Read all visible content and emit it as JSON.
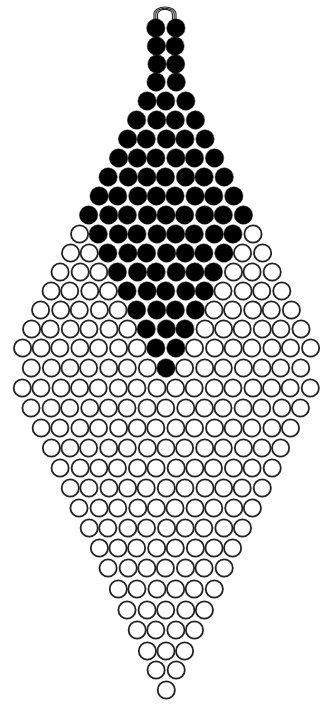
{
  "diagram": {
    "type": "bead-pattern",
    "colors": {
      "filled": "#000000",
      "open": "#ffffff",
      "outline": "#222222",
      "background": "#ffffff"
    },
    "loop": {
      "cx": 165,
      "cy": 14,
      "rx": 11,
      "ry": 7,
      "strands": 3
    },
    "bead_spacing_x": 19.2,
    "bead_radius": 8.6,
    "rows": [
      {
        "y": 28,
        "beads": [
          "F",
          "F"
        ]
      },
      {
        "y": 46,
        "beads": [
          "F",
          "F"
        ]
      },
      {
        "y": 64,
        "beads": [
          "F",
          "F"
        ]
      },
      {
        "y": 82,
        "beads": [
          "F",
          "F"
        ]
      },
      {
        "y": 101,
        "beads": [
          "F",
          "F",
          "F"
        ]
      },
      {
        "y": 120,
        "beads": [
          "F",
          "F",
          "F",
          "F"
        ]
      },
      {
        "y": 139,
        "beads": [
          "F",
          "F",
          "F",
          "F",
          "F"
        ]
      },
      {
        "y": 158,
        "beads": [
          "F",
          "F",
          "F",
          "F",
          "F",
          "F"
        ]
      },
      {
        "y": 177,
        "beads": [
          "F",
          "F",
          "F",
          "F",
          "F",
          "F",
          "F"
        ]
      },
      {
        "y": 196,
        "beads": [
          "F",
          "F",
          "F",
          "F",
          "F",
          "F",
          "F",
          "F"
        ]
      },
      {
        "y": 215,
        "beads": [
          "F",
          "F",
          "F",
          "F",
          "F",
          "F",
          "F",
          "F",
          "F"
        ]
      },
      {
        "y": 234,
        "beads": [
          "O",
          "F",
          "F",
          "F",
          "F",
          "F",
          "F",
          "F",
          "F",
          "O"
        ]
      },
      {
        "y": 253,
        "beads": [
          "O",
          "O",
          "F",
          "F",
          "F",
          "F",
          "F",
          "F",
          "F",
          "O",
          "O"
        ]
      },
      {
        "y": 272,
        "beads": [
          "O",
          "O",
          "O",
          "F",
          "F",
          "F",
          "F",
          "F",
          "F",
          "O",
          "O",
          "O"
        ]
      },
      {
        "y": 291,
        "beads": [
          "O",
          "O",
          "O",
          "O",
          "F",
          "F",
          "F",
          "F",
          "F",
          "O",
          "O",
          "O",
          "O"
        ]
      },
      {
        "y": 310,
        "beads": [
          "O",
          "O",
          "O",
          "O",
          "O",
          "F",
          "F",
          "F",
          "F",
          "O",
          "O",
          "O",
          "O",
          "O"
        ]
      },
      {
        "y": 329,
        "beads": [
          "O",
          "O",
          "O",
          "O",
          "O",
          "O",
          "F",
          "F",
          "F",
          "O",
          "O",
          "O",
          "O",
          "O",
          "O"
        ]
      },
      {
        "y": 348,
        "beads": [
          "O",
          "O",
          "O",
          "O",
          "O",
          "O",
          "O",
          "F",
          "F",
          "O",
          "O",
          "O",
          "O",
          "O",
          "O",
          "O"
        ]
      },
      {
        "y": 368,
        "beads": [
          "O",
          "O",
          "O",
          "O",
          "O",
          "O",
          "O",
          "F",
          "O",
          "O",
          "O",
          "O",
          "O",
          "O",
          "O"
        ]
      },
      {
        "y": 388,
        "beads": [
          "O",
          "O",
          "O",
          "O",
          "O",
          "O",
          "O",
          "O",
          "O",
          "O",
          "O",
          "O",
          "O",
          "O",
          "O",
          "O"
        ]
      },
      {
        "y": 408,
        "beads": [
          "O",
          "O",
          "O",
          "O",
          "O",
          "O",
          "O",
          "O",
          "O",
          "O",
          "O",
          "O",
          "O",
          "O",
          "O"
        ]
      },
      {
        "y": 428,
        "beads": [
          "O",
          "O",
          "O",
          "O",
          "O",
          "O",
          "O",
          "O",
          "O",
          "O",
          "O",
          "O",
          "O",
          "O"
        ]
      },
      {
        "y": 448,
        "beads": [
          "O",
          "O",
          "O",
          "O",
          "O",
          "O",
          "O",
          "O",
          "O",
          "O",
          "O",
          "O",
          "O"
        ]
      },
      {
        "y": 468,
        "beads": [
          "O",
          "O",
          "O",
          "O",
          "O",
          "O",
          "O",
          "O",
          "O",
          "O",
          "O",
          "O"
        ]
      },
      {
        "y": 488,
        "beads": [
          "O",
          "O",
          "O",
          "O",
          "O",
          "O",
          "O",
          "O",
          "O",
          "O",
          "O"
        ]
      },
      {
        "y": 508,
        "beads": [
          "O",
          "O",
          "O",
          "O",
          "O",
          "O",
          "O",
          "O",
          "O",
          "O"
        ]
      },
      {
        "y": 528,
        "beads": [
          "O",
          "O",
          "O",
          "O",
          "O",
          "O",
          "O",
          "O",
          "O"
        ]
      },
      {
        "y": 548,
        "beads": [
          "O",
          "O",
          "O",
          "O",
          "O",
          "O",
          "O",
          "O"
        ]
      },
      {
        "y": 568,
        "beads": [
          "O",
          "O",
          "O",
          "O",
          "O",
          "O",
          "O"
        ]
      },
      {
        "y": 589,
        "beads": [
          "O",
          "O",
          "O",
          "O",
          "O",
          "O"
        ]
      },
      {
        "y": 610,
        "beads": [
          "O",
          "O",
          "O",
          "O",
          "O"
        ]
      },
      {
        "y": 630,
        "beads": [
          "O",
          "O",
          "O",
          "O"
        ]
      },
      {
        "y": 651,
        "beads": [
          "O",
          "O",
          "O"
        ]
      },
      {
        "y": 670,
        "beads": [
          "O",
          "O"
        ]
      },
      {
        "y": 690,
        "beads": [
          "O"
        ]
      }
    ],
    "counts": {
      "total_rows": 35,
      "widest_row_beads": 16
    }
  }
}
